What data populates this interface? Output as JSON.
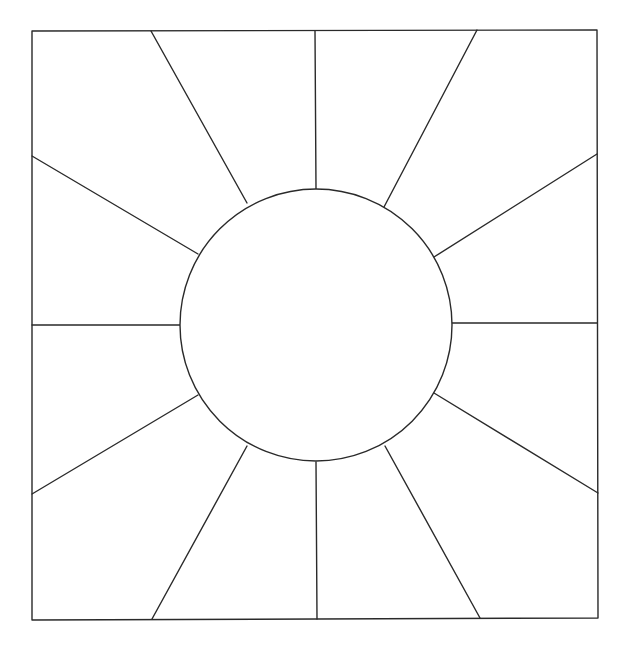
{
  "diagram": {
    "canvas": {
      "width": 629,
      "height": 650,
      "background": "#ffffff"
    },
    "stroke": {
      "color": "#2a2a2a",
      "width": 1.4
    },
    "square": {
      "corners": [
        [
          32,
          31
        ],
        [
          597,
          30
        ],
        [
          598,
          618
        ],
        [
          32,
          620
        ]
      ]
    },
    "circle": {
      "cx": 316,
      "cy": 325,
      "r": 136,
      "fill": "#ffffff"
    },
    "spokes": [
      {
        "name": "spoke-12-oclock",
        "from": [
          316,
          189
        ],
        "to": [
          315,
          31
        ]
      },
      {
        "name": "spoke-1-oclock",
        "from": [
          384,
          207
        ],
        "to": [
          477,
          30
        ]
      },
      {
        "name": "spoke-2-oclock",
        "from": [
          434,
          257
        ],
        "to": [
          597,
          154
        ]
      },
      {
        "name": "spoke-3-oclock",
        "from": [
          452,
          323
        ],
        "to": [
          597,
          323
        ]
      },
      {
        "name": "spoke-4-oclock",
        "from": [
          434,
          393
        ],
        "to": [
          598,
          493
        ]
      },
      {
        "name": "spoke-5-oclock",
        "from": [
          385,
          446
        ],
        "to": [
          480,
          618
        ]
      },
      {
        "name": "spoke-6-oclock",
        "from": [
          316,
          462
        ],
        "to": [
          317,
          619
        ]
      },
      {
        "name": "spoke-7-oclock",
        "from": [
          247,
          446
        ],
        "to": [
          152,
          619
        ]
      },
      {
        "name": "spoke-8-oclock",
        "from": [
          198,
          395
        ],
        "to": [
          32,
          494
        ]
      },
      {
        "name": "spoke-9-oclock",
        "from": [
          180,
          325
        ],
        "to": [
          32,
          325
        ]
      },
      {
        "name": "spoke-10-oclock",
        "from": [
          198,
          254
        ],
        "to": [
          32,
          156
        ]
      },
      {
        "name": "spoke-11-oclock",
        "from": [
          247,
          203
        ],
        "to": [
          151,
          31
        ]
      }
    ],
    "segment_count": 12
  }
}
